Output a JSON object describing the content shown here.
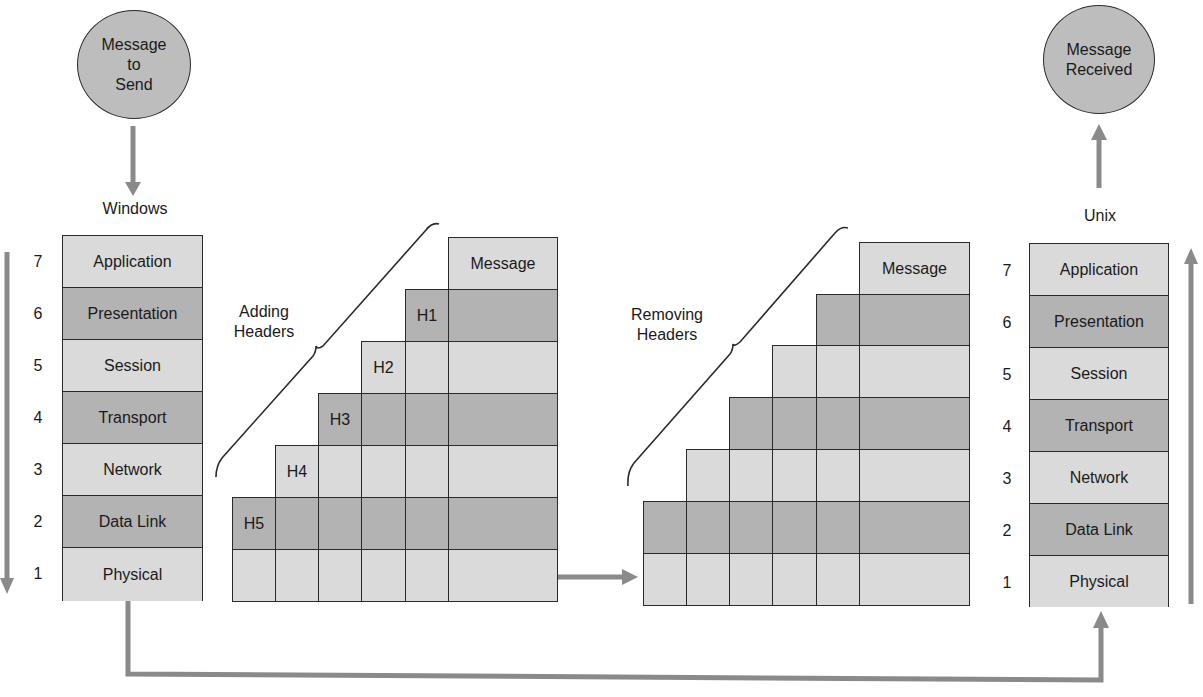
{
  "sender": {
    "circle_label": "Message\nto\nSend",
    "os_label": "Windows",
    "layers": [
      {
        "num": "7",
        "name": "Application",
        "shade": "light"
      },
      {
        "num": "6",
        "name": "Presentation",
        "shade": "dark"
      },
      {
        "num": "5",
        "name": "Session",
        "shade": "light"
      },
      {
        "num": "4",
        "name": "Transport",
        "shade": "dark"
      },
      {
        "num": "3",
        "name": "Network",
        "shade": "light"
      },
      {
        "num": "2",
        "name": "Data Link",
        "shade": "dark"
      },
      {
        "num": "1",
        "name": "Physical",
        "shade": "light"
      }
    ]
  },
  "receiver": {
    "circle_label": "Message\nReceived",
    "os_label": "Unix",
    "layers": [
      {
        "num": "7",
        "name": "Application",
        "shade": "light"
      },
      {
        "num": "6",
        "name": "Presentation",
        "shade": "dark"
      },
      {
        "num": "5",
        "name": "Session",
        "shade": "light"
      },
      {
        "num": "4",
        "name": "Transport",
        "shade": "dark"
      },
      {
        "num": "3",
        "name": "Network",
        "shade": "light"
      },
      {
        "num": "2",
        "name": "Data Link",
        "shade": "dark"
      },
      {
        "num": "1",
        "name": "Physical",
        "shade": "light"
      }
    ]
  },
  "adding": {
    "brace_label": "Adding\nHeaders",
    "message_label": "Message",
    "headers": [
      "H1",
      "H2",
      "H3",
      "H4",
      "H5"
    ]
  },
  "removing": {
    "brace_label": "Removing\nHeaders",
    "message_label": "Message"
  },
  "colors": {
    "light_fill": "#dadada",
    "dark_fill": "#b3b3b3",
    "arrow": "#8a8a8a",
    "stroke": "#2a2a2a"
  }
}
